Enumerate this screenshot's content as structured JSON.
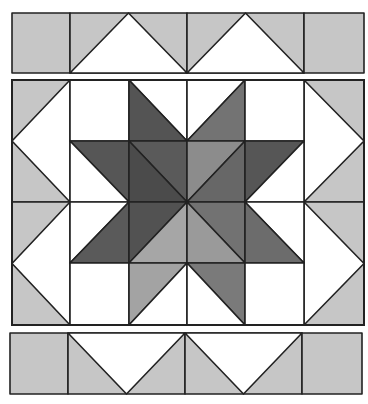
{
  "title": "Eight-pointed star quilt block with flying geese borders",
  "colors": {
    "white": "#ffffff",
    "light": "#c6c6c6",
    "line": "#222222",
    "background": "#ffffff"
  },
  "top_border": {
    "y": 13,
    "h": 60,
    "units": [
      {
        "type": "square",
        "x": 12,
        "w": 58,
        "fill": "#c6c6c6"
      },
      {
        "type": "goose-up",
        "x": 70,
        "w": 117,
        "fill": "#c6c6c6",
        "goose": "#ffffff"
      },
      {
        "type": "goose-up",
        "x": 187,
        "w": 117,
        "fill": "#c6c6c6",
        "goose": "#ffffff"
      },
      {
        "type": "square",
        "x": 304,
        "w": 60,
        "fill": "#c6c6c6"
      }
    ]
  },
  "bottom_border": {
    "y": 333,
    "h": 61,
    "units": [
      {
        "type": "square",
        "x": 10,
        "w": 58,
        "fill": "#c6c6c6"
      },
      {
        "type": "goose-down",
        "x": 68,
        "w": 117,
        "fill": "#c6c6c6",
        "goose": "#ffffff"
      },
      {
        "type": "goose-down",
        "x": 185,
        "w": 117,
        "fill": "#c6c6c6",
        "goose": "#ffffff"
      },
      {
        "type": "square",
        "x": 302,
        "w": 60,
        "fill": "#c6c6c6"
      }
    ]
  },
  "main_block": {
    "x": 12,
    "y": 80,
    "w": 352,
    "h": 245,
    "cols": [
      12,
      70,
      129,
      187,
      245,
      304,
      364
    ],
    "rows": [
      80,
      141,
      202,
      263,
      325
    ],
    "side_units": [
      {
        "side": "left",
        "x": 12,
        "w": 58,
        "y": 80,
        "h": 122,
        "fill": "#c6c6c6",
        "goose": "#ffffff"
      },
      {
        "side": "left",
        "x": 12,
        "w": 58,
        "y": 202,
        "h": 123,
        "fill": "#c6c6c6",
        "goose": "#ffffff"
      },
      {
        "side": "right",
        "x": 304,
        "w": 60,
        "y": 80,
        "h": 122,
        "fill": "#c6c6c6",
        "goose": "#ffffff"
      },
      {
        "side": "right",
        "x": 304,
        "w": 60,
        "y": 202,
        "h": 123,
        "fill": "#c6c6c6",
        "goose": "#ffffff"
      }
    ],
    "cells": [
      {
        "r": 0,
        "c": 1,
        "diag": "none",
        "a": "#ffffff"
      },
      {
        "r": 0,
        "c": 2,
        "diag": "tl-br",
        "a": "#ffffff",
        "b": "#545454"
      },
      {
        "r": 0,
        "c": 3,
        "diag": "tr-bl",
        "a": "#ffffff",
        "b": "#737373"
      },
      {
        "r": 0,
        "c": 4,
        "diag": "none",
        "a": "#ffffff"
      },
      {
        "r": 1,
        "c": 1,
        "diag": "tl-br",
        "a": "#565656",
        "b": "#ffffff"
      },
      {
        "r": 1,
        "c": 2,
        "diag": "tl-br",
        "a": "#5a5a5a",
        "b": "#4b4b4b"
      },
      {
        "r": 1,
        "c": 3,
        "diag": "tr-bl",
        "a": "#8c8c8c",
        "b": "#676767"
      },
      {
        "r": 1,
        "c": 4,
        "diag": "tr-bl",
        "a": "#565656",
        "b": "#ffffff"
      },
      {
        "r": 2,
        "c": 1,
        "diag": "tr-bl",
        "a": "#ffffff",
        "b": "#5a5a5a"
      },
      {
        "r": 2,
        "c": 2,
        "diag": "tr-bl",
        "a": "#525252",
        "b": "#a6a6a6"
      },
      {
        "r": 2,
        "c": 3,
        "diag": "tl-br",
        "a": "#727272",
        "b": "#9a9a9a"
      },
      {
        "r": 2,
        "c": 4,
        "diag": "tl-br",
        "a": "#ffffff",
        "b": "#6c6c6c"
      },
      {
        "r": 3,
        "c": 1,
        "diag": "none",
        "a": "#ffffff"
      },
      {
        "r": 3,
        "c": 2,
        "diag": "tr-bl",
        "a": "#a3a3a3",
        "b": "#ffffff"
      },
      {
        "r": 3,
        "c": 3,
        "diag": "tl-br",
        "a": "#7a7a7a",
        "b": "#ffffff"
      },
      {
        "r": 3,
        "c": 4,
        "diag": "none",
        "a": "#ffffff"
      }
    ],
    "legend_note": "For diag tl-br: a = upper-right triangle, b = lower-left triangle. For diag tr-bl: a = upper-left triangle, b = lower-right triangle."
  }
}
